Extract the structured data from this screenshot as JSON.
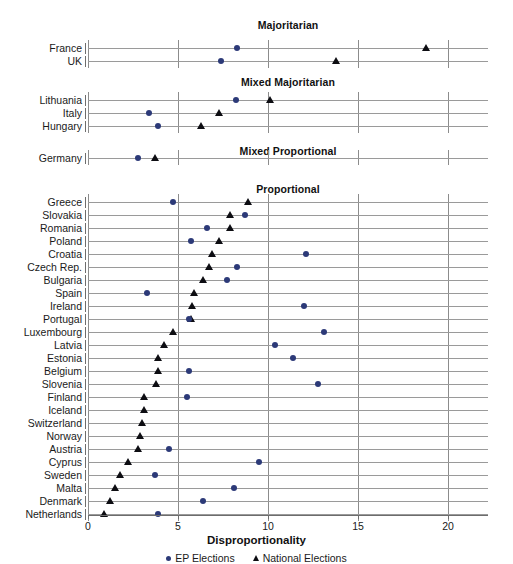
{
  "chart_data": {
    "type": "scatter",
    "title": "",
    "xlabel": "Disproportionality",
    "ylabel": "",
    "xlim": [
      0,
      22.2
    ],
    "xticks": [
      0,
      5,
      10,
      15,
      20
    ],
    "xtick_labels": [
      "0",
      "5",
      "10",
      "15",
      "20"
    ],
    "grid": true,
    "legend_position": "bottom",
    "series": [
      {
        "name": "EP Elections",
        "marker": "circle",
        "color": "#2c3a78"
      },
      {
        "name": "National Elections",
        "marker": "triangle",
        "color": "#0d0d12"
      }
    ],
    "panels": [
      {
        "title": "Majoritarian",
        "rows": [
          {
            "label": "France",
            "ep": 8.3,
            "national": 18.8
          },
          {
            "label": "UK",
            "ep": 7.4,
            "national": 13.8
          }
        ]
      },
      {
        "title": "Mixed Majoritarian",
        "rows": [
          {
            "label": "Lithuania",
            "ep": 8.2,
            "national": 10.1
          },
          {
            "label": "Italy",
            "ep": 3.4,
            "national": 7.3
          },
          {
            "label": "Hungary",
            "ep": 3.9,
            "national": 6.3
          }
        ]
      },
      {
        "title": "Mixed Proportional",
        "rows": [
          {
            "label": "Germany",
            "ep": 2.8,
            "national": 3.7
          }
        ]
      },
      {
        "title": "Proportional",
        "rows": [
          {
            "label": "Greece",
            "ep": 4.7,
            "national": 8.9
          },
          {
            "label": "Slovakia",
            "ep": 8.7,
            "national": 7.9
          },
          {
            "label": "Romania",
            "ep": 6.6,
            "national": 7.9
          },
          {
            "label": "Poland",
            "ep": 5.7,
            "national": 7.3
          },
          {
            "label": "Croatia",
            "ep": 12.1,
            "national": 6.9
          },
          {
            "label": "Czech Rep.",
            "ep": 8.3,
            "national": 6.7
          },
          {
            "label": "Bulgaria",
            "ep": 7.7,
            "national": 6.4
          },
          {
            "label": "Spain",
            "ep": 3.3,
            "national": 5.9
          },
          {
            "label": "Ireland",
            "ep": 12.0,
            "national": 5.8
          },
          {
            "label": "Portugal",
            "ep": 5.6,
            "national": 5.7
          },
          {
            "label": "Luxembourg",
            "ep": 13.1,
            "national": 4.7
          },
          {
            "label": "Latvia",
            "ep": 10.4,
            "national": 4.2
          },
          {
            "label": "Estonia",
            "ep": 11.4,
            "national": 3.9
          },
          {
            "label": "Belgium",
            "ep": 5.6,
            "national": 3.9
          },
          {
            "label": "Slovenia",
            "ep": 12.8,
            "national": 3.8
          },
          {
            "label": "Finland",
            "ep": 5.5,
            "national": 3.1
          },
          {
            "label": "Iceland",
            "ep": null,
            "national": 3.1
          },
          {
            "label": "Switzerland",
            "ep": null,
            "national": 3.0
          },
          {
            "label": "Norway",
            "ep": null,
            "national": 2.9
          },
          {
            "label": "Austria",
            "ep": 4.5,
            "national": 2.8
          },
          {
            "label": "Cyprus",
            "ep": 9.5,
            "national": 2.2
          },
          {
            "label": "Sweden",
            "ep": 3.7,
            "national": 1.8
          },
          {
            "label": "Malta",
            "ep": 8.1,
            "national": 1.5
          },
          {
            "label": "Denmark",
            "ep": 6.4,
            "national": 1.2
          },
          {
            "label": "Netherlands",
            "ep": 3.9,
            "national": 0.9
          }
        ]
      }
    ]
  }
}
